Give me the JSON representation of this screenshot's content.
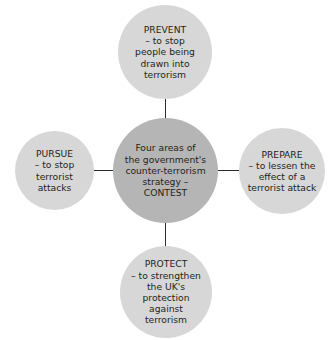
{
  "diagram": {
    "type": "hub-and-spoke",
    "background_color": "#ffffff",
    "center_color": "#b5b5b5",
    "node_color": "#d7d7d7",
    "connector_color": "#2b2b2b",
    "text_color": "#231f20",
    "center": {
      "id": "contest",
      "text": "Four areas of\nthe government's\ncounter-terrorism\nstrategy –\nCONTEST"
    },
    "nodes": [
      {
        "id": "prevent",
        "position": "top",
        "heading": "PREVENT",
        "description": "– to stop people being drawn into terrorism",
        "text": "PREVENT\n– to stop\npeople being\ndrawn into\nterrorism"
      },
      {
        "id": "pursue",
        "position": "left",
        "heading": "PURSUE",
        "description": "– to stop terrorist attacks",
        "text": "PURSUE\n– to stop\nterrorist\nattacks"
      },
      {
        "id": "prepare",
        "position": "right",
        "heading": "PREPARE",
        "description": "– to lessen the effect of a terrorist attack",
        "text": "PREPARE\n– to lessen the\neffect of a\nterrorist attack"
      },
      {
        "id": "protect",
        "position": "bottom",
        "heading": "PROTECT",
        "description": "– to strengthen the UK's protection against terrorism",
        "text": "PROTECT\n– to strengthen\nthe UK's\nprotection\nagainst\nterrorism"
      }
    ]
  }
}
